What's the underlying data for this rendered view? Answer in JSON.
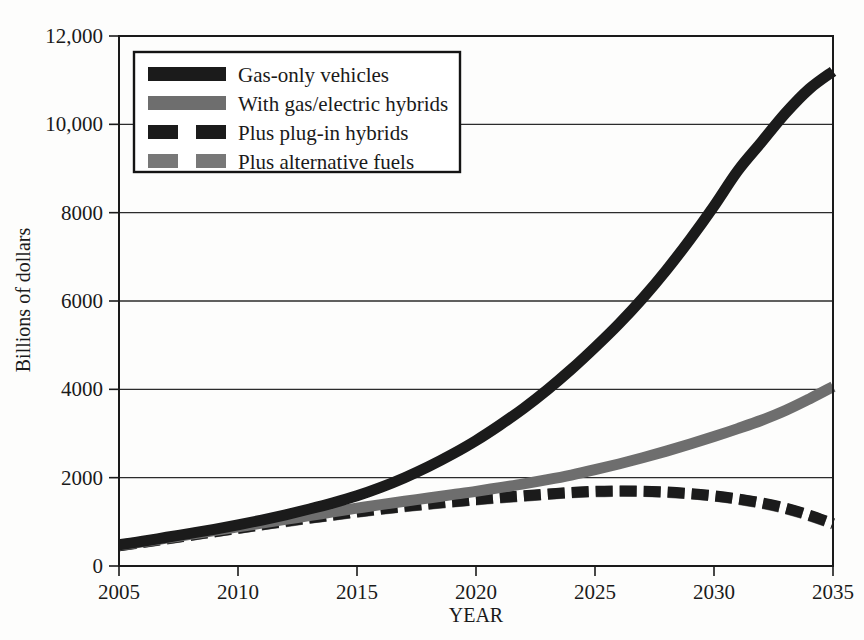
{
  "chart_data": {
    "type": "line",
    "title": "",
    "xlabel": "YEAR",
    "ylabel": "Billions of dollars",
    "xlim": [
      2005,
      2035
    ],
    "ylim": [
      0,
      12000
    ],
    "grid": true,
    "legend_position": "top-left-inside",
    "xticks": [
      "2005",
      "2010",
      "2015",
      "2020",
      "2025",
      "2030",
      "2035"
    ],
    "xtick_values": [
      2005,
      2010,
      2015,
      2020,
      2025,
      2030,
      2035
    ],
    "yticks": [
      "0",
      "2000",
      "4000",
      "6000",
      "8000",
      "10,000",
      "12,000"
    ],
    "ytick_values": [
      0,
      2000,
      4000,
      6000,
      8000,
      10000,
      12000
    ],
    "x": [
      2005,
      2006,
      2007,
      2008,
      2009,
      2010,
      2011,
      2012,
      2013,
      2014,
      2015,
      2016,
      2017,
      2018,
      2019,
      2020,
      2021,
      2022,
      2023,
      2024,
      2025,
      2026,
      2027,
      2028,
      2029,
      2030,
      2031,
      2032,
      2033,
      2034,
      2035
    ],
    "series": [
      {
        "name": "Gas-only vehicles",
        "color": "#1b1b1b",
        "style": "solid",
        "width": 11,
        "values": [
          480,
          560,
          650,
          740,
          830,
          930,
          1040,
          1160,
          1290,
          1430,
          1590,
          1780,
          2000,
          2250,
          2530,
          2840,
          3190,
          3570,
          3990,
          4450,
          4950,
          5480,
          6060,
          6700,
          7400,
          8150,
          8950,
          9600,
          10250,
          10800,
          11200
        ]
      },
      {
        "name": "With gas/electric hybrids",
        "color": "#6e6e6e",
        "style": "solid",
        "width": 11,
        "values": [
          470,
          545,
          630,
          715,
          800,
          885,
          970,
          1055,
          1140,
          1225,
          1310,
          1390,
          1465,
          1540,
          1615,
          1690,
          1775,
          1860,
          1955,
          2060,
          2180,
          2310,
          2450,
          2600,
          2760,
          2930,
          3110,
          3300,
          3520,
          3780,
          4060
        ]
      },
      {
        "name": "Plus plug-in hybrids",
        "color": "#1b1b1b",
        "style": "dashed",
        "width": 11,
        "values": [
          460,
          535,
          615,
          695,
          775,
          855,
          935,
          1010,
          1085,
          1155,
          1225,
          1290,
          1350,
          1405,
          1455,
          1505,
          1550,
          1590,
          1630,
          1665,
          1690,
          1700,
          1695,
          1675,
          1640,
          1590,
          1520,
          1430,
          1310,
          1150,
          960
        ]
      },
      {
        "name": "Plus alternative fuels",
        "color": "#787878",
        "style": "dashed",
        "width": 11,
        "values": [
          455,
          530,
          610,
          690,
          770,
          850,
          928,
          1003,
          1078,
          1148,
          1218,
          1282,
          1342,
          1397,
          1447,
          1495,
          1540,
          1580,
          1620,
          1655,
          1680,
          1690,
          1685,
          1665,
          1630,
          1580,
          1510,
          1420,
          1300,
          1140,
          950
        ]
      }
    ]
  },
  "legend": {
    "items": [
      {
        "label": "Gas-only vehicles",
        "swatch": "solid-black"
      },
      {
        "label": "With gas/electric hybrids",
        "swatch": "solid-gray"
      },
      {
        "label": "Plus plug-in hybrids",
        "swatch": "dashed-black"
      },
      {
        "label": "Plus alternative fuels",
        "swatch": "dashed-gray"
      }
    ]
  }
}
